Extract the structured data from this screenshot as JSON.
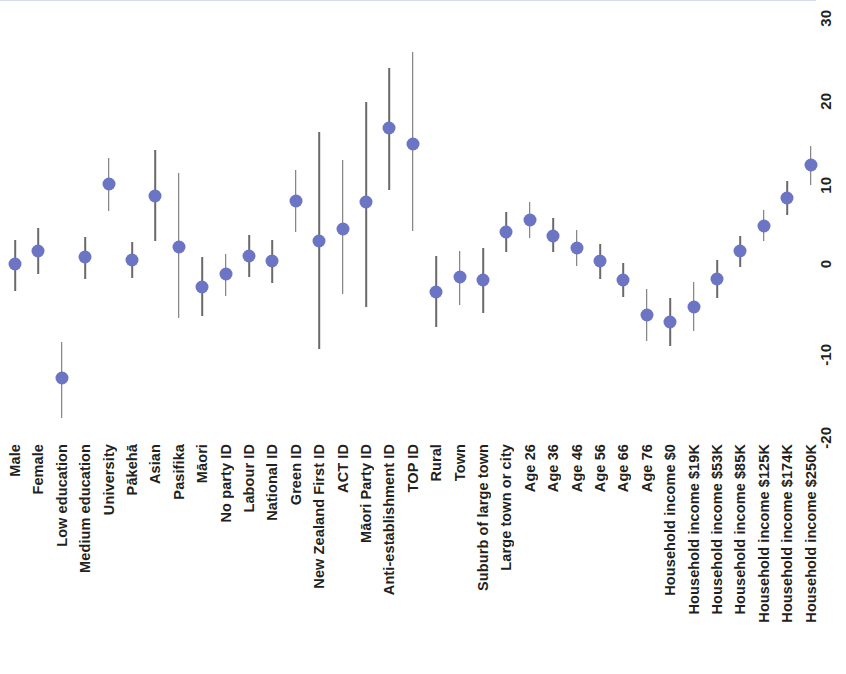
{
  "chart_data": {
    "type": "scatter",
    "title": "",
    "subtitle": "",
    "xlabel": "",
    "ylabel": "",
    "ylim": [
      -24,
      32
    ],
    "yticks": [
      30,
      20,
      10,
      0,
      -10,
      -20
    ],
    "ytick_labels": [
      "30",
      "20",
      "10",
      "0",
      "-10",
      "-20"
    ],
    "grid": false,
    "legend": null,
    "zero_reference_line": 0,
    "orientation": "vertical-error-bars",
    "axis_position": "right",
    "point_color": "#6b75c4",
    "error_bar_color": "#6a6a6a",
    "zero_line_color": "#cfd3e6",
    "categories": [
      "Male",
      "Female",
      "Low education",
      "Medium education",
      "University",
      "Pākehā",
      "Asian",
      "Pasifika",
      "Māori",
      "No party ID",
      "Labour ID",
      "National ID",
      "Green ID",
      "New Zealand First ID",
      "ACT ID",
      "Māori Party ID",
      "Anti-establishment ID",
      "TOP ID",
      "Rural",
      "Town",
      "Suburb of large town",
      "Large town or city",
      "Age 26",
      "Age 36",
      "Age 46",
      "Age 56",
      "Age 66",
      "Age 76",
      "Household income $0",
      "Household income $19K",
      "Household income $53K",
      "Household income $85K",
      "Household income $125K",
      "Household income $174K",
      "Household income $250K"
    ],
    "groups": [
      {
        "name": "Gender",
        "start": 0,
        "end": 1
      },
      {
        "name": "Education",
        "start": 2,
        "end": 4
      },
      {
        "name": "Ethnicity",
        "start": 5,
        "end": 8
      },
      {
        "name": "Party identification",
        "start": 9,
        "end": 17
      },
      {
        "name": "Settlement type",
        "start": 18,
        "end": 21
      },
      {
        "name": "Age",
        "start": 22,
        "end": 27
      },
      {
        "name": "Household income",
        "start": 28,
        "end": 34
      }
    ],
    "estimates": [
      0.6,
      2.1,
      -13.1,
      1.4,
      10.2,
      1.1,
      8.8,
      2.6,
      -2.1,
      -0.6,
      1.6,
      0.9,
      8.1,
      3.3,
      4.8,
      8.0,
      16.9,
      15.0,
      -2.7,
      -1.0,
      -1.3,
      4.4,
      5.9,
      4.0,
      2.5,
      0.9,
      -1.3,
      -5.5,
      -6.3,
      -4.5,
      -1.2,
      2.1,
      5.2,
      8.5,
      12.4
    ],
    "ci_low": [
      -2.6,
      -0.6,
      -17.8,
      -1.2,
      7.0,
      -1.1,
      3.3,
      -5.9,
      -5.6,
      -3.2,
      -1.0,
      -1.7,
      4.4,
      -9.6,
      -3.0,
      -4.5,
      9.4,
      4.6,
      -6.9,
      -4.3,
      -5.3,
      2.0,
      3.7,
      2.0,
      0.3,
      -1.2,
      -3.3,
      -8.6,
      -9.2,
      -7.4,
      -3.5,
      0.2,
      3.3,
      6.5,
      10.1
    ],
    "ci_high": [
      3.5,
      4.9,
      -8.7,
      3.8,
      13.3,
      3.2,
      14.2,
      11.5,
      1.4,
      1.8,
      4.1,
      3.5,
      11.9,
      16.4,
      13.0,
      20.0,
      24.1,
      26.0,
      1.5,
      2.2,
      2.5,
      6.8,
      8.0,
      6.1,
      4.7,
      3.0,
      0.7,
      -2.4,
      -3.5,
      -1.6,
      1.1,
      4.0,
      7.1,
      10.5,
      14.7
    ],
    "units": "percentage points"
  },
  "axis": {
    "y_tick_labels": [
      "30",
      "20",
      "10",
      "0",
      "-10",
      "-20"
    ]
  }
}
